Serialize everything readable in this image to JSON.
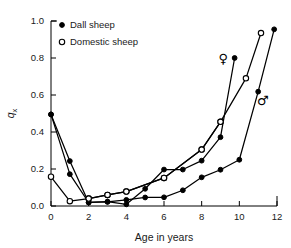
{
  "chart_data": {
    "type": "line",
    "title": "",
    "xlabel": "Age in years",
    "ylabel": "q",
    "ylabel_sub": "x",
    "xlim": [
      0,
      12
    ],
    "ylim": [
      0.0,
      1.0
    ],
    "xticks": [
      0,
      2,
      4,
      6,
      8,
      10,
      12
    ],
    "xtick_labels": [
      "0",
      "2",
      "4",
      "6",
      "8",
      "10",
      "12"
    ],
    "yticks": [
      0.0,
      0.2,
      0.4,
      0.6,
      0.8,
      1.0
    ],
    "ytick_labels": [
      "0.0",
      "0.2",
      "0.4",
      "0.6",
      "0.8",
      "1.0"
    ],
    "grid": false,
    "legend_position": "upper-left",
    "legend": [
      {
        "label": "Dall sheep",
        "marker": "filled-circle"
      },
      {
        "label": "Domestic sheep",
        "marker": "open-circle"
      }
    ],
    "annotations": [
      {
        "text": "♀",
        "name": "female-symbol",
        "x": 9.15,
        "y": 0.775
      },
      {
        "text": "♂",
        "name": "male-symbol",
        "x": 11.25,
        "y": 0.545
      }
    ],
    "series": [
      {
        "name": "Dall sheep female",
        "marker": "filled-circle",
        "points": [
          [
            0,
            0.495
          ],
          [
            1,
            0.243
          ],
          [
            2,
            0.019
          ],
          [
            3,
            0.024
          ],
          [
            4,
            0.009
          ],
          [
            5,
            0.093
          ],
          [
            6,
            0.197
          ],
          [
            7,
            0.197
          ],
          [
            8,
            0.245
          ],
          [
            9,
            0.372
          ],
          [
            9.75,
            0.8
          ]
        ]
      },
      {
        "name": "Dall sheep male",
        "marker": "filled-circle",
        "points": [
          [
            0,
            0.495
          ],
          [
            1,
            0.172
          ],
          [
            2,
            0.019
          ],
          [
            3,
            0.022
          ],
          [
            4,
            0.033
          ],
          [
            5,
            0.046
          ],
          [
            6,
            0.047
          ],
          [
            7,
            0.085
          ],
          [
            8,
            0.155
          ],
          [
            9,
            0.196
          ],
          [
            10,
            0.25
          ],
          [
            11,
            0.618
          ],
          [
            11.85,
            0.955
          ]
        ]
      },
      {
        "name": "Domestic sheep female",
        "marker": "open-circle",
        "points": [
          [
            0,
            0.158
          ],
          [
            1,
            0.026
          ],
          [
            2,
            0.04
          ],
          [
            3,
            0.06
          ],
          [
            4,
            0.078
          ],
          [
            6,
            0.152
          ],
          [
            8,
            0.305
          ],
          [
            9,
            0.455
          ],
          [
            10.35,
            0.69
          ],
          [
            11.15,
            0.935
          ]
        ]
      },
      {
        "name": "Domestic sheep male",
        "marker": "open-circle",
        "points": [
          [
            2,
            0.04
          ],
          [
            3,
            0.06
          ],
          [
            4,
            0.078
          ],
          [
            6,
            0.152
          ],
          [
            8,
            0.305
          ],
          [
            9,
            0.455
          ]
        ]
      }
    ]
  }
}
